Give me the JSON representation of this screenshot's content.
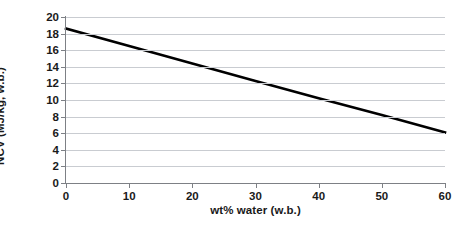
{
  "chart_data": {
    "type": "line",
    "title": "",
    "xlabel": "wt% water (w.b.)",
    "ylabel": "NCV (MJ/kg, w.b.)",
    "xlim": [
      0,
      60
    ],
    "ylim": [
      0,
      20
    ],
    "xticks": [
      0,
      10,
      20,
      30,
      40,
      50,
      60
    ],
    "yticks": [
      0,
      2,
      4,
      6,
      8,
      10,
      12,
      14,
      16,
      18,
      20
    ],
    "grid": "horizontal",
    "legend": "none",
    "series": [
      {
        "name": "NCV",
        "color": "#000000",
        "x": [
          0,
          10,
          20,
          30,
          40,
          50,
          60
        ],
        "values": [
          18.6,
          16.5,
          14.4,
          12.3,
          10.2,
          8.2,
          6.1
        ]
      }
    ],
    "colors": {
      "line": "#000000",
      "grid": "#c9ccd1",
      "axis": "#7d8085",
      "text": "#1a1a1a",
      "background": "#ffffff"
    }
  }
}
